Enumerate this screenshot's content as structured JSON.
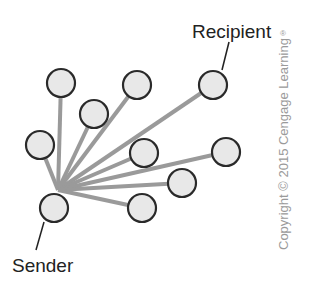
{
  "diagram": {
    "title_labels": {
      "recipient": "Recipient",
      "sender": "Sender"
    },
    "copyright": "Copyright © 2015 Cengage Learning",
    "copyright_mark": "®",
    "colors": {
      "node_fill": "#e8e8e8",
      "node_stroke": "#2a2a2a",
      "edge": "#9a9a9a",
      "text": "#222222",
      "copyright": "#9a9a9a"
    },
    "hub": {
      "x": 58,
      "y": 190
    },
    "nodes": [
      {
        "id": "n1",
        "x": 61,
        "y": 83
      },
      {
        "id": "n2",
        "x": 137,
        "y": 85
      },
      {
        "id": "recipient",
        "x": 213,
        "y": 85
      },
      {
        "id": "n4",
        "x": 94,
        "y": 114
      },
      {
        "id": "n5",
        "x": 40,
        "y": 145
      },
      {
        "id": "n6",
        "x": 144,
        "y": 153
      },
      {
        "id": "n7",
        "x": 226,
        "y": 152
      },
      {
        "id": "n8",
        "x": 182,
        "y": 183
      },
      {
        "id": "sender",
        "x": 54,
        "y": 208
      },
      {
        "id": "n10",
        "x": 142,
        "y": 208
      }
    ]
  }
}
